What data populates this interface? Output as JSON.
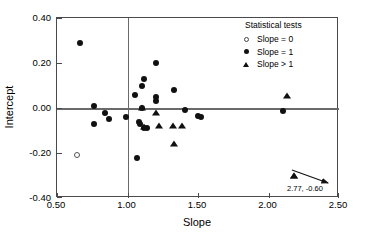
{
  "chart_data": {
    "type": "scatter",
    "title": "",
    "xlabel": "Slope",
    "ylabel": "Intercept",
    "xlim": [
      0.5,
      2.5
    ],
    "ylim": [
      -0.4,
      0.4
    ],
    "xticks": [
      "0.50",
      "1.00",
      "1.50",
      "2.00",
      "2.50"
    ],
    "xtick_values": [
      0.5,
      1.0,
      1.5,
      2.0,
      2.5
    ],
    "yticks": [
      "0.40",
      "0.20",
      "0.00",
      "-0.20",
      "-0.40"
    ],
    "ytick_values": [
      0.4,
      0.2,
      0.0,
      -0.2,
      -0.4
    ],
    "grid": false,
    "reference_lines": [
      {
        "axis": "x",
        "value": 1.0
      },
      {
        "axis": "y",
        "value": 0.0
      }
    ],
    "legend": {
      "position": "top-right",
      "title": "Statistical tests",
      "entries": [
        {
          "marker": "open-circle",
          "label": "Slope = 0"
        },
        {
          "marker": "filled-circle",
          "label": "Slope = 1"
        },
        {
          "marker": "filled-triangle",
          "label": "Slope > 1"
        }
      ]
    },
    "annotations": [
      {
        "text": "2.77, -0.60",
        "x": 2.18,
        "y": -0.3,
        "marker": "filled-triangle",
        "arrow": true
      }
    ],
    "series": [
      {
        "name": "Slope = 0",
        "marker": "open-circle",
        "points": [
          {
            "x": 0.64,
            "y": -0.21
          }
        ]
      },
      {
        "name": "Slope = 1",
        "marker": "filled-circle",
        "points": [
          {
            "x": 0.66,
            "y": 0.29
          },
          {
            "x": 0.76,
            "y": 0.01
          },
          {
            "x": 0.76,
            "y": -0.07
          },
          {
            "x": 0.84,
            "y": -0.02
          },
          {
            "x": 0.87,
            "y": -0.05
          },
          {
            "x": 0.99,
            "y": -0.04
          },
          {
            "x": 1.05,
            "y": 0.06
          },
          {
            "x": 1.07,
            "y": -0.22
          },
          {
            "x": 1.08,
            "y": -0.06
          },
          {
            "x": 1.09,
            "y": -0.07
          },
          {
            "x": 1.1,
            "y": 0.1
          },
          {
            "x": 1.1,
            "y": 0.0
          },
          {
            "x": 1.12,
            "y": 0.13
          },
          {
            "x": 1.12,
            "y": -0.09
          },
          {
            "x": 1.14,
            "y": -0.09
          },
          {
            "x": 1.2,
            "y": 0.2
          },
          {
            "x": 1.2,
            "y": 0.05
          },
          {
            "x": 1.2,
            "y": 0.03
          },
          {
            "x": 1.33,
            "y": 0.08
          },
          {
            "x": 1.41,
            "y": -0.01
          },
          {
            "x": 1.5,
            "y": -0.035
          },
          {
            "x": 1.52,
            "y": -0.04
          },
          {
            "x": 2.1,
            "y": -0.015
          }
        ]
      },
      {
        "name": "Slope > 1",
        "marker": "filled-triangle",
        "points": [
          {
            "x": 1.1,
            "y": 0.0
          },
          {
            "x": 1.12,
            "y": -0.085
          },
          {
            "x": 1.2,
            "y": -0.02
          },
          {
            "x": 1.22,
            "y": -0.08
          },
          {
            "x": 1.32,
            "y": -0.08
          },
          {
            "x": 1.33,
            "y": -0.16
          },
          {
            "x": 1.39,
            "y": -0.08
          },
          {
            "x": 2.13,
            "y": 0.055
          },
          {
            "x": 2.18,
            "y": -0.3
          }
        ]
      }
    ]
  }
}
